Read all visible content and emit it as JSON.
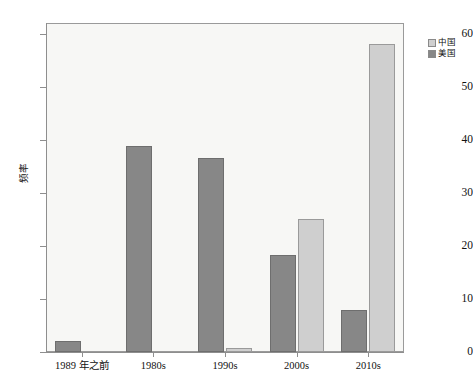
{
  "chart_data": {
    "type": "bar",
    "title": "",
    "xlabel": "",
    "ylabel": "频率",
    "categories": [
      "1989 年之前",
      "1980s",
      "1990s",
      "2000s",
      "2010s"
    ],
    "series": [
      {
        "name": "中国",
        "color": "#cfcfcf",
        "values": [
          0,
          0,
          0.7,
          25.0,
          58.0
        ]
      },
      {
        "name": "美国",
        "color": "#878787",
        "values": [
          2.0,
          38.8,
          36.6,
          18.3,
          8.0
        ]
      }
    ],
    "ylim": [
      0,
      62
    ],
    "yticks": [
      0,
      10,
      20,
      30,
      40,
      50,
      60
    ],
    "ytick_labels": [
      "0",
      "10",
      "20",
      "30",
      "40",
      "50",
      "60"
    ],
    "grid": false,
    "legend_position": "right"
  },
  "legend": {
    "entries": [
      {
        "label": "中国",
        "swatch": "light-gray"
      },
      {
        "label": "美国",
        "swatch": "dark-gray"
      }
    ]
  },
  "axes": {
    "y_label": "频率"
  },
  "colors": {
    "china": "#cfcfcf",
    "usa": "#878787",
    "panel_background": "#f7f7f5",
    "axis": "#8e8e8e",
    "page_background": "#ffffff"
  }
}
